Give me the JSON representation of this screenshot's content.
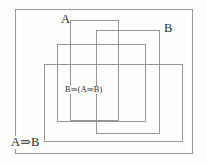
{
  "figure": {
    "width": 207,
    "height": 164,
    "background_color": "#fefefe",
    "line_color": "#8d8d8d",
    "text_color": "#2b2b2b"
  },
  "labels": {
    "antecedent_a": "A",
    "antecedent_b": "B",
    "inner_formula": "B⇒(A⇒B)",
    "outer_formula": "A⇒B"
  },
  "boxes": {
    "frame": {
      "x": 15,
      "y": 9,
      "width": 178,
      "height": 145
    },
    "scope_a": {
      "x": 70,
      "y": 20,
      "width": 49,
      "height": 101
    },
    "scope_b": {
      "x": 96,
      "y": 30,
      "width": 64,
      "height": 104
    },
    "scope_inner": {
      "x": 57,
      "y": 44,
      "width": 89,
      "height": 78
    },
    "scope_outer": {
      "x": 44,
      "y": 64,
      "width": 139,
      "height": 78
    }
  }
}
